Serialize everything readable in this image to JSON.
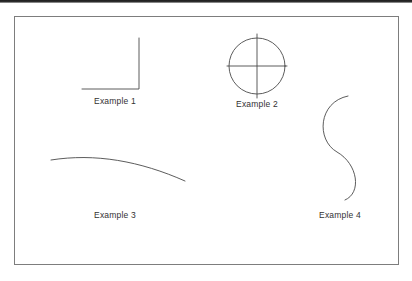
{
  "page": {
    "background_color": "#ffffff",
    "scan_edge_color": "#1d1d1d",
    "frame_border_color": "#7d7d7d",
    "ink_color": "#4a4a4a"
  },
  "figure": {
    "labels": [
      {
        "id": "example-1",
        "text": "Example 1",
        "shape": "right-triangle"
      },
      {
        "id": "example-2",
        "text": "Example 2",
        "shape": "circle-with-crosshair"
      },
      {
        "id": "example-3",
        "text": "Example 3",
        "shape": "shallow-arc-curve"
      },
      {
        "id": "example-4",
        "text": "Example 4",
        "shape": "s-curve"
      }
    ],
    "shapes": {
      "triangle": {
        "name": "right-triangle",
        "points": "139,38 139,89 82,89",
        "description": "Right triangle, right angle at bottom right, hypotenuse from bottom-left to top-right"
      },
      "circle": {
        "name": "circle-with-crosshair",
        "cx": 257,
        "cy": 66,
        "r": 28,
        "crosshair_overshoot": 4,
        "description": "Circle with vertical and horizontal diameter lines extending slightly past the rim"
      },
      "arc": {
        "name": "shallow-arc-curve",
        "path": "M 51 160 C 95 153, 140 161, 185 181",
        "description": "Long shallow arc rising slightly then falling to the right"
      },
      "scurve": {
        "name": "s-curve",
        "path": "M 348 96 C 318 102, 316 140, 337 152 C 358 164, 362 193, 345 200",
        "description": "Vertical S shape, open to the left at top and to the right at bottom"
      }
    }
  }
}
